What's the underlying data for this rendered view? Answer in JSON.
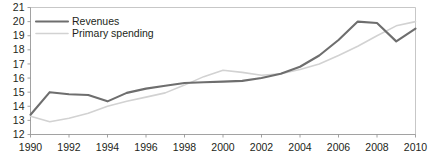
{
  "chart_data": {
    "type": "line",
    "title": "",
    "subtitle": "",
    "xlabel": "",
    "ylabel": "",
    "xlim": [
      1990,
      2010
    ],
    "ylim": [
      12,
      21
    ],
    "ytick_step": 1,
    "xtick_step": 2,
    "grid": false,
    "legend_position": "top-left",
    "x": [
      1990,
      1991,
      1992,
      1993,
      1994,
      1995,
      1996,
      1997,
      1998,
      1999,
      2000,
      2001,
      2002,
      2003,
      2004,
      2005,
      2006,
      2007,
      2008,
      2009,
      2010
    ],
    "xtick_labels": [
      "1990",
      "1992",
      "1994",
      "1996",
      "1998",
      "2000",
      "2002",
      "2004",
      "2006",
      "2008",
      "2010"
    ],
    "xtick_values": [
      1990,
      1992,
      1994,
      1996,
      1998,
      2000,
      2002,
      2004,
      2006,
      2008,
      2010
    ],
    "ytick_labels": [
      "12",
      "13",
      "14",
      "15",
      "16",
      "17",
      "18",
      "19",
      "20",
      "21"
    ],
    "ytick_values": [
      12,
      13,
      14,
      15,
      16,
      17,
      18,
      19,
      20,
      21
    ],
    "series": [
      {
        "name": "Revenues",
        "color": "#6e6e6e",
        "width": 2.1,
        "values": [
          13.4,
          15.0,
          14.85,
          14.8,
          14.35,
          14.95,
          15.25,
          15.45,
          15.65,
          15.7,
          15.75,
          15.8,
          16.0,
          16.3,
          16.8,
          17.6,
          18.7,
          20.0,
          19.9,
          18.6,
          19.5
        ]
      },
      {
        "name": "Primary spending",
        "color": "#d2d2d2",
        "width": 1.6,
        "values": [
          13.3,
          12.9,
          13.15,
          13.5,
          14.0,
          14.35,
          14.65,
          14.95,
          15.5,
          16.1,
          16.55,
          16.4,
          16.2,
          16.3,
          16.6,
          17.0,
          17.6,
          18.25,
          19.0,
          19.7,
          20.0
        ]
      }
    ],
    "legend": [
      {
        "label": "Revenues",
        "color": "#6e6e6e",
        "width": 2.1
      },
      {
        "label": "Primary spending",
        "color": "#d2d2d2",
        "width": 1.6
      }
    ]
  }
}
